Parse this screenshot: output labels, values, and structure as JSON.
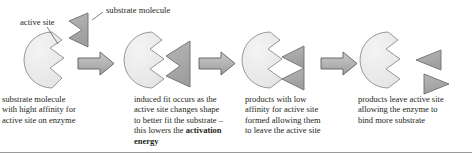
{
  "diagram": {
    "callouts": [
      {
        "id": "active-site",
        "text": "active site"
      },
      {
        "id": "substrate-molecule",
        "text": "substrate molecule"
      }
    ],
    "stages": [
      {
        "index": 1,
        "name": "free-enzyme-and-substrate",
        "caption": "substrate molecule\nwith hight affinity for\nactive site on enzyme"
      },
      {
        "index": 2,
        "name": "induced-fit-complex",
        "caption_pre": "induced fit occurs as the\nactive site changes shape\nto better fit the substrate –\nthis lowers the ",
        "caption_bold": "activation energy",
        "caption_post": ""
      },
      {
        "index": 3,
        "name": "products-formed",
        "caption": "products with low\naffinity for active site\nformed allowing them\nto leave the active site"
      },
      {
        "index": 4,
        "name": "products-released",
        "caption": "products leave active site\nallowing the enzyme to\nbind more substrate"
      }
    ],
    "arrows": [
      {
        "name": "arrow-stage1-to-stage2"
      },
      {
        "name": "arrow-stage2-to-stage3"
      },
      {
        "name": "arrow-stage3-to-stage4"
      }
    ],
    "colors": {
      "enzyme_fill": "#ededed",
      "enzyme_stroke": "#8c8c8c",
      "substrate_fill": "#a8a8a8",
      "substrate_stroke": "#6e6e6e",
      "arrow_fill": "#b4b4b4",
      "arrow_stroke": "#5f5f5f",
      "text": "#231f20",
      "rule": "#9a9a9a"
    }
  }
}
